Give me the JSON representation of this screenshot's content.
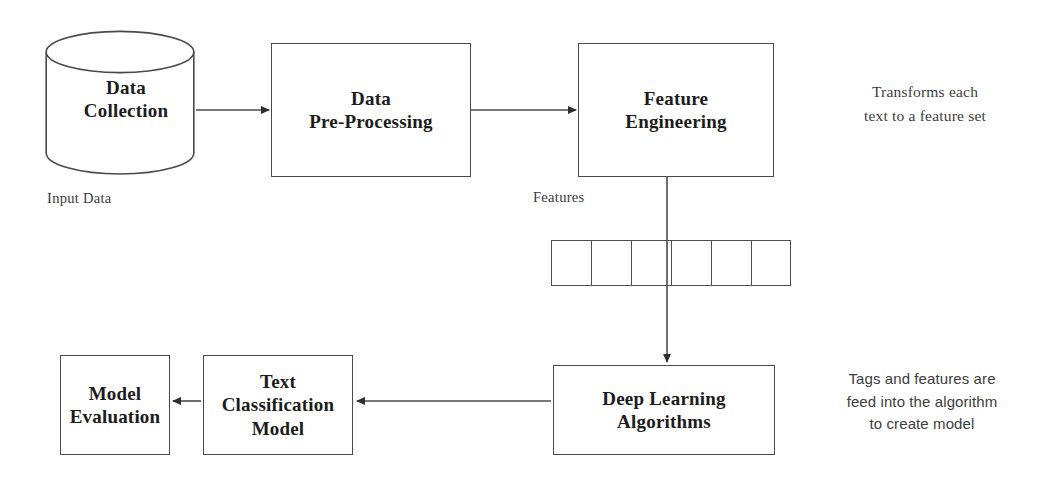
{
  "diagram": {
    "stroke_color": "#4a4a4a",
    "text_color": "#1c1c1c",
    "background": "#ffffff"
  },
  "nodes": {
    "data_collection": {
      "label": "Data\nCollection",
      "shape": "cylinder"
    },
    "data_preprocessing": {
      "label": "Data\nPre-Processing",
      "shape": "rectangle"
    },
    "feature_engineering": {
      "label": "Feature\nEngineering",
      "shape": "rectangle"
    },
    "deep_learning": {
      "label": "Deep Learning\nAlgorithms",
      "shape": "rectangle"
    },
    "text_classification": {
      "label": "Text\nClassification\nModel",
      "shape": "rectangle"
    },
    "model_evaluation": {
      "label": "Model\nEvaluation",
      "shape": "rectangle"
    }
  },
  "captions": {
    "input_data": "Input Data",
    "features": "Features"
  },
  "annotations": {
    "feature_note": "Transforms each\ntext to a feature set",
    "algorithm_note": "Tags and features are\nfeed into the algorithm\nto create model"
  },
  "feature_vector": {
    "cell_count": 6,
    "cell_values": [
      "",
      "",
      "",
      "",
      "",
      ""
    ]
  }
}
